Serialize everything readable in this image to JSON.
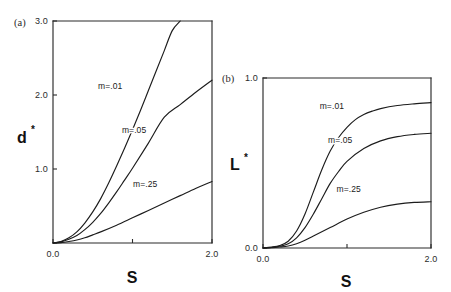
{
  "figure": {
    "background": "#ffffff",
    "ink_color": "#1c1c1c",
    "width": 451,
    "height": 292
  },
  "chart_data": [
    {
      "id": "panel-a",
      "type": "line",
      "panel_tag": "(a)",
      "title": "",
      "xlabel": "S",
      "ylabel": "d*",
      "ylabel_base": "d",
      "ylabel_star": "*",
      "xlim": [
        0.0,
        2.0
      ],
      "ylim": [
        0.0,
        3.0
      ],
      "grid": false,
      "legend_position": "inline-curve-labels",
      "xticks": [
        0.0,
        1.0,
        2.0
      ],
      "xticklabels": [
        "0.0",
        "",
        "2.0"
      ],
      "yticks": [
        0.0,
        1.0,
        2.0,
        3.0
      ],
      "yticklabels": [
        "",
        "1.0",
        "2.0",
        "3.0"
      ],
      "series": [
        {
          "name": "m=.01",
          "label": "m=.01",
          "x": [
            0.0,
            0.1,
            0.2,
            0.3,
            0.4,
            0.5,
            0.6,
            0.7,
            0.8,
            0.9,
            1.0,
            1.1,
            1.2,
            1.3,
            1.4,
            1.5,
            1.6
          ],
          "values": [
            0.0,
            0.02,
            0.07,
            0.15,
            0.27,
            0.42,
            0.6,
            0.81,
            1.04,
            1.28,
            1.53,
            1.79,
            2.06,
            2.33,
            2.6,
            2.87,
            3.0
          ]
        },
        {
          "name": "m=.05",
          "label": "m=.05",
          "x": [
            0.0,
            0.1,
            0.2,
            0.3,
            0.4,
            0.5,
            0.6,
            0.7,
            0.8,
            0.9,
            1.0,
            1.2,
            1.4,
            1.6,
            1.8,
            2.0
          ],
          "values": [
            0.0,
            0.015,
            0.05,
            0.1,
            0.18,
            0.28,
            0.4,
            0.54,
            0.69,
            0.85,
            1.01,
            1.35,
            1.7,
            1.87,
            2.04,
            2.2
          ]
        },
        {
          "name": "m=.25",
          "label": "m=.25",
          "x": [
            0.0,
            0.1,
            0.2,
            0.3,
            0.4,
            0.5,
            0.6,
            0.8,
            1.0,
            1.2,
            1.4,
            1.6,
            1.8,
            2.0
          ],
          "values": [
            0.0,
            0.005,
            0.02,
            0.04,
            0.07,
            0.11,
            0.15,
            0.24,
            0.34,
            0.44,
            0.54,
            0.64,
            0.74,
            0.83
          ]
        }
      ],
      "annotations": [
        {
          "text": "m=.01",
          "x": 0.72,
          "y": 2.08
        },
        {
          "text": "m=.05",
          "x": 1.02,
          "y": 1.48
        },
        {
          "text": "m=.25",
          "x": 1.16,
          "y": 0.76
        }
      ]
    },
    {
      "id": "panel-b",
      "type": "line",
      "panel_tag": "(b)",
      "title": "",
      "xlabel": "S",
      "ylabel": "L*",
      "ylabel_base": "L",
      "ylabel_star": "*",
      "xlim": [
        0.0,
        2.0
      ],
      "ylim": [
        0.0,
        1.0
      ],
      "grid": false,
      "legend_position": "inline-curve-labels",
      "xticks": [
        0.0,
        1.0,
        2.0
      ],
      "xticklabels": [
        "0.0",
        "",
        "2.0"
      ],
      "yticks": [
        0.0,
        1.0
      ],
      "yticklabels": [
        "0.0",
        "1.0"
      ],
      "series": [
        {
          "name": "m=.01",
          "label": "m=.01",
          "x": [
            0.0,
            0.1,
            0.2,
            0.3,
            0.4,
            0.5,
            0.6,
            0.7,
            0.8,
            0.9,
            1.0,
            1.1,
            1.2,
            1.3,
            1.4,
            1.6,
            1.8,
            2.0
          ],
          "values": [
            0.0,
            0.005,
            0.015,
            0.04,
            0.1,
            0.2,
            0.33,
            0.46,
            0.57,
            0.65,
            0.71,
            0.755,
            0.785,
            0.805,
            0.82,
            0.838,
            0.848,
            0.855
          ]
        },
        {
          "name": "m=.05",
          "label": "m=.05",
          "x": [
            0.0,
            0.1,
            0.2,
            0.3,
            0.4,
            0.5,
            0.6,
            0.7,
            0.8,
            0.9,
            1.0,
            1.2,
            1.4,
            1.6,
            1.8,
            2.0
          ],
          "values": [
            0.0,
            0.003,
            0.01,
            0.025,
            0.06,
            0.12,
            0.2,
            0.29,
            0.38,
            0.45,
            0.51,
            0.585,
            0.63,
            0.655,
            0.668,
            0.675
          ]
        },
        {
          "name": "m=.25",
          "label": "m=.25",
          "x": [
            0.0,
            0.1,
            0.2,
            0.3,
            0.4,
            0.5,
            0.6,
            0.8,
            1.0,
            1.2,
            1.4,
            1.6,
            1.8,
            2.0
          ],
          "values": [
            0.0,
            0.002,
            0.006,
            0.012,
            0.025,
            0.045,
            0.07,
            0.12,
            0.17,
            0.21,
            0.24,
            0.258,
            0.268,
            0.272
          ]
        }
      ],
      "annotations": [
        {
          "text": "m=.01",
          "x": 0.82,
          "y": 0.815
        },
        {
          "text": "m=.05",
          "x": 0.92,
          "y": 0.62
        },
        {
          "text": "m=.25",
          "x": 1.02,
          "y": 0.33
        }
      ]
    }
  ]
}
